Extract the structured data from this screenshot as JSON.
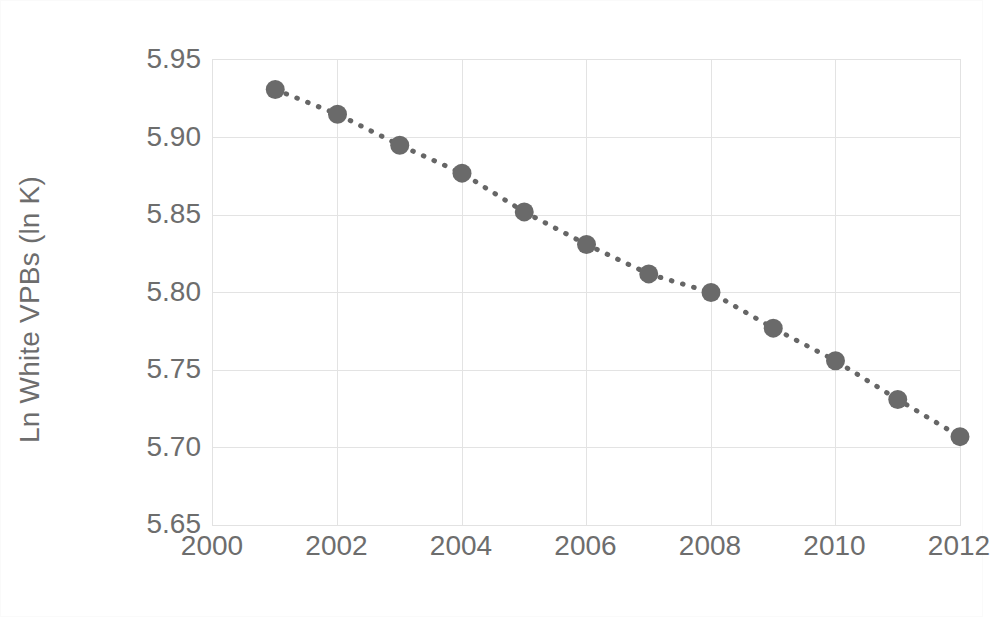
{
  "figure": {
    "background_color": "#ffffff",
    "border_color": "#fafafa",
    "plot_border_color": "#e2e2e2",
    "gridline_color": "#e3e3e3",
    "series_color": "#666666",
    "marker_color": "#6a6a6a",
    "text_color": "#6d6d6d"
  },
  "chart_data": {
    "type": "scatter",
    "title": "",
    "subtitle": "",
    "xlabel": "",
    "ylabel": "Ln White VPBs (ln K)",
    "x": [
      2001,
      2002,
      2003,
      2004,
      2005,
      2006,
      2007,
      2008,
      2009,
      2010,
      2011,
      2012
    ],
    "values": [
      5.931,
      5.915,
      5.895,
      5.877,
      5.852,
      5.831,
      5.812,
      5.8,
      5.777,
      5.756,
      5.731,
      5.707
    ],
    "series": [
      {
        "name": "Ln White VPBs (ln K)",
        "values": [
          5.931,
          5.915,
          5.895,
          5.877,
          5.852,
          5.831,
          5.812,
          5.8,
          5.777,
          5.756,
          5.731,
          5.707
        ],
        "marker": "circle",
        "line_style": "dotted",
        "color": "#666666"
      }
    ],
    "xlim": [
      2000,
      2012
    ],
    "ylim": [
      5.65,
      5.95
    ],
    "xticks": [
      2000,
      2002,
      2004,
      2006,
      2008,
      2010,
      2012
    ],
    "xtick_labels": [
      "2000",
      "2002",
      "2004",
      "2006",
      "2008",
      "2010",
      "2012"
    ],
    "yticks": [
      5.65,
      5.7,
      5.75,
      5.8,
      5.85,
      5.9,
      5.95
    ],
    "ytick_labels": [
      "5.65",
      "5.70",
      "5.75",
      "5.80",
      "5.85",
      "5.90",
      "5.95"
    ],
    "grid": {
      "horizontal": true,
      "vertical": true
    },
    "legend": {
      "visible": false,
      "position": "none"
    },
    "annotations": []
  }
}
